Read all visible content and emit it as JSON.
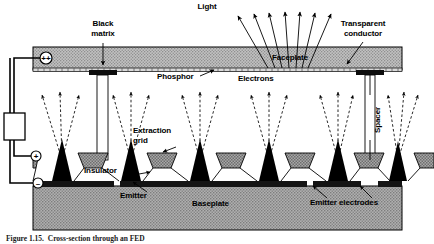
{
  "figure": {
    "caption": "Figure 1.15.  Cross-section through an FED",
    "labels": {
      "light": "Light",
      "black_matrix": "Black\nmatrix",
      "transparent_conductor": "Transparent\nconductor",
      "faceplate": "Faceplate",
      "phosphor": "Phosphor",
      "electrons": "Electrons",
      "spacer": "Spacer",
      "extraction_grid": "Extraction\ngrid",
      "insulator": "Insulator",
      "emitter": "Emitter",
      "baseplate": "Baseplate",
      "emitter_electrodes": "Emitter electrodes"
    },
    "terminals": {
      "anode": "++",
      "grid": "+",
      "cathode": "−"
    },
    "colors": {
      "ink": "#000000",
      "faceplate_fill": "#b3b3b3",
      "baseplate_fill": "#9e9e9e",
      "grid_fill": "#8c8c8c",
      "black_matrix": "#111111",
      "background": "#ffffff",
      "electrode_fill": "#1a1a1a"
    }
  }
}
